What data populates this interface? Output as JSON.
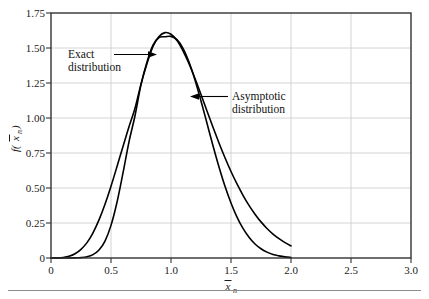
{
  "figure": {
    "background_color": "#ffffff",
    "frame_color": "#333333",
    "grid_color": "#c9c9c9",
    "curve_color": "#000000"
  },
  "annotations": [
    {
      "name": "exact-distribution",
      "line1": "Exact",
      "line2": "distribution",
      "arrow": "right"
    },
    {
      "name": "asymptotic-distribution",
      "line1": "Asymptotic",
      "line2": "distribution",
      "arrow": "left"
    }
  ],
  "axes": {
    "x_title_base": "x",
    "x_title_sub": "n",
    "y_title_prefix": "f(",
    "y_title_base": "x",
    "y_title_sub": "n",
    "y_title_suffix": ")",
    "x_ticks": [
      "0",
      "0.5",
      "1.0",
      "1.5",
      "2.0",
      "2.5",
      "3.0"
    ],
    "y_ticks": [
      "0",
      "0.25",
      "0.50",
      "0.75",
      "1.00",
      "1.25",
      "1.50",
      "1.75"
    ]
  },
  "chart_data": {
    "type": "line",
    "title": "",
    "xlabel": "x̄ₙ",
    "ylabel": "f(x̄ₙ)",
    "xlim": [
      0,
      3.0
    ],
    "ylim": [
      0,
      1.75
    ],
    "xticks": [
      0,
      0.5,
      1.0,
      1.5,
      2.0,
      2.5,
      3.0
    ],
    "yticks": [
      0,
      0.25,
      0.5,
      0.75,
      1.0,
      1.25,
      1.5,
      1.75
    ],
    "grid": true,
    "legend": "none",
    "annotations": [
      {
        "text": "Exact distribution",
        "points_to_x": 0.87,
        "points_to_y": 1.46
      },
      {
        "text": "Asymptotic distribution",
        "points_to_x": 1.12,
        "points_to_y": 1.16
      }
    ],
    "series": [
      {
        "name": "Exact distribution",
        "x": [
          0.0,
          0.05,
          0.1,
          0.15,
          0.2,
          0.25,
          0.3,
          0.35,
          0.4,
          0.45,
          0.5,
          0.55,
          0.6,
          0.65,
          0.7,
          0.75,
          0.8,
          0.85,
          0.9,
          0.95,
          1.0,
          1.05,
          1.1,
          1.15,
          1.2,
          1.25,
          1.3,
          1.35,
          1.4,
          1.45,
          1.5,
          1.55,
          1.6,
          1.65,
          1.7,
          1.75,
          1.8,
          1.85,
          1.9,
          1.95,
          2.0
        ],
        "y": [
          0.0,
          0.001,
          0.004,
          0.012,
          0.03,
          0.062,
          0.11,
          0.18,
          0.272,
          0.384,
          0.513,
          0.653,
          0.797,
          0.938,
          1.069,
          1.242,
          1.39,
          1.512,
          1.582,
          1.61,
          1.598,
          1.553,
          1.48,
          1.388,
          1.282,
          1.168,
          1.05,
          0.934,
          0.822,
          0.716,
          0.618,
          0.529,
          0.448,
          0.376,
          0.313,
          0.258,
          0.211,
          0.171,
          0.138,
          0.11,
          0.087
        ]
      },
      {
        "name": "Asymptotic distribution",
        "x": [
          0.0,
          0.05,
          0.1,
          0.15,
          0.2,
          0.25,
          0.3,
          0.35,
          0.4,
          0.45,
          0.5,
          0.55,
          0.6,
          0.65,
          0.7,
          0.75,
          0.8,
          0.85,
          0.9,
          0.95,
          1.0,
          1.05,
          1.1,
          1.15,
          1.2,
          1.25,
          1.3,
          1.35,
          1.4,
          1.45,
          1.5,
          1.55,
          1.6,
          1.65,
          1.7,
          1.75,
          1.8,
          1.85,
          1.9,
          1.95,
          2.0
        ],
        "y": [
          0.0,
          0.0,
          0.0,
          0.0,
          0.001,
          0.003,
          0.009,
          0.024,
          0.057,
          0.121,
          0.233,
          0.398,
          0.608,
          0.83,
          1.016,
          1.238,
          1.4,
          1.52,
          1.575,
          1.58,
          1.583,
          1.56,
          1.498,
          1.4,
          1.272,
          1.122,
          0.962,
          0.802,
          0.65,
          0.512,
          0.393,
          0.292,
          0.211,
          0.148,
          0.1,
          0.066,
          0.042,
          0.025,
          0.015,
          0.008,
          0.004
        ]
      }
    ]
  }
}
